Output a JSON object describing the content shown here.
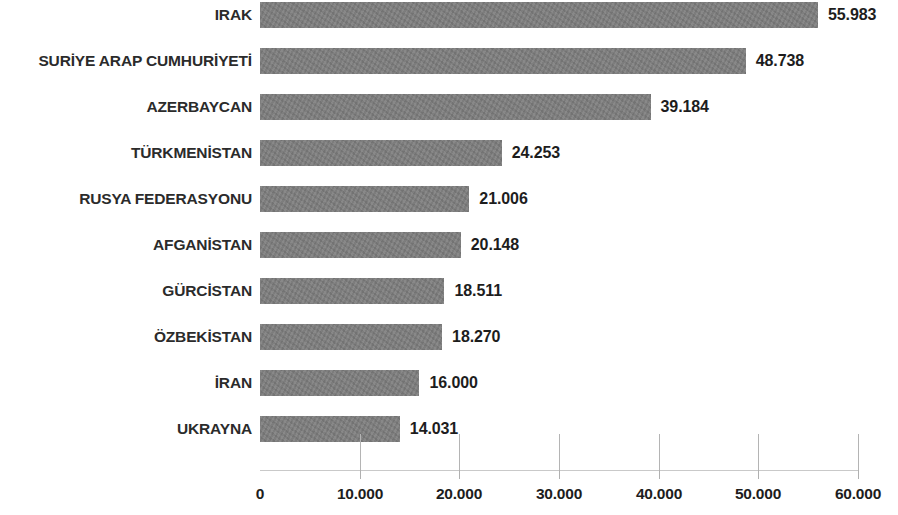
{
  "chart_data": {
    "type": "bar",
    "orientation": "horizontal",
    "title": "",
    "subtitle": "",
    "xlabel": "",
    "ylabel": "",
    "grid": false,
    "legend": false,
    "legend_position": "none",
    "bar_color": "#7d7d7d",
    "text_color": "#231f20",
    "axis_color": "#c9c9c9",
    "xlim": [
      0,
      60000
    ],
    "xticks": [
      0,
      10000,
      20000,
      30000,
      40000,
      50000,
      60000
    ],
    "xtick_labels": [
      "0",
      "10.000",
      "20.000",
      "30.000",
      "40.000",
      "50.000",
      "60.000"
    ],
    "number_format": "dot-thousands-separator",
    "categories": [
      "IRAK",
      "SURİYE ARAP CUMHURİYETİ",
      "AZERBAYCAN",
      "TÜRKMENİSTAN",
      "RUSYA FEDERASYONU",
      "AFGANİSTAN",
      "GÜRCİSTAN",
      "ÖZBEKİSTAN",
      "İRAN",
      "UKRAYNA"
    ],
    "values": [
      55983,
      48738,
      39184,
      24253,
      21006,
      20148,
      18511,
      18270,
      16000,
      14031
    ],
    "value_labels": [
      "55.983",
      "48.738",
      "39.184",
      "24.253",
      "21.006",
      "20.148",
      "18.511",
      "18.270",
      "16.000",
      "14.031"
    ]
  }
}
